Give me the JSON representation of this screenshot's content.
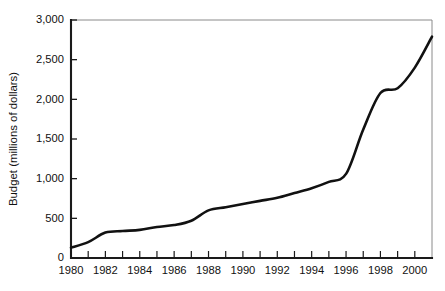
{
  "chart_data": {
    "type": "line",
    "title": "",
    "xlabel": "",
    "ylabel": "Budget (millions of dollars)",
    "xlim": [
      1980,
      2001
    ],
    "ylim": [
      0,
      3000
    ],
    "grid": false,
    "legend": "none",
    "line_color": "#111111",
    "axis_color": "#1a1a1a",
    "frame_color": "#8a8a8a",
    "x_tick_step": 1,
    "x_label_step": 2,
    "y_tick_step": 500,
    "y_tick_labels": [
      "0",
      "500",
      "1,000",
      "1,500",
      "2,000",
      "2,500",
      "3,000"
    ],
    "y_tick_values": [
      0,
      500,
      1000,
      1500,
      2000,
      2500,
      3000
    ],
    "x_tick_values": [
      1980,
      1981,
      1982,
      1983,
      1984,
      1985,
      1986,
      1987,
      1988,
      1989,
      1990,
      1991,
      1992,
      1993,
      1994,
      1995,
      1996,
      1997,
      1998,
      1999,
      2000,
      2001
    ],
    "x_tick_labels": [
      "1980",
      "",
      "1982",
      "",
      "1984",
      "",
      "1986",
      "",
      "1988",
      "",
      "1990",
      "",
      "1992",
      "",
      "1994",
      "",
      "1996",
      "",
      "1998",
      "",
      "2000",
      ""
    ],
    "x": [
      1980,
      1981,
      1982,
      1983,
      1984,
      1985,
      1986,
      1987,
      1988,
      1989,
      1990,
      1991,
      1992,
      1993,
      1994,
      1995,
      1996,
      1997,
      1998,
      1999,
      2000,
      2001
    ],
    "values": [
      130,
      200,
      320,
      340,
      355,
      390,
      415,
      470,
      600,
      640,
      680,
      720,
      760,
      820,
      880,
      960,
      1060,
      1620,
      2080,
      2140,
      2400,
      2790
    ],
    "series": [
      {
        "name": "Budget",
        "values": [
          130,
          200,
          320,
          340,
          355,
          390,
          415,
          470,
          600,
          640,
          680,
          720,
          760,
          820,
          880,
          960,
          1060,
          1620,
          2080,
          2140,
          2400,
          2790
        ]
      }
    ]
  }
}
